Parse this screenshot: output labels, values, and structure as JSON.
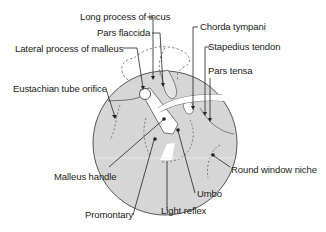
{
  "diagram": {
    "colors": {
      "membrane_fill": "#d6d6d6",
      "outline": "#555555",
      "leader_line": "#222222",
      "background": "#ffffff"
    },
    "labels": {
      "long_process_of_incus": "Long process of incus",
      "pars_flaccida": "Pars flaccida",
      "lateral_process_of_malleus": "Lateral process of malleus",
      "chorda_tympani": "Chorda tympani",
      "stapedius_tendon": "Stapedius tendon",
      "pars_tensa": "Pars tensa",
      "eustachian_tube_orifice": "Eustachian tube orifice",
      "malleus_handle": "Malleus handle",
      "umbo": "Umbo",
      "round_window_niche": "Round window niche",
      "promontary": "Promontary",
      "light_reflex": "Light reflex"
    }
  }
}
